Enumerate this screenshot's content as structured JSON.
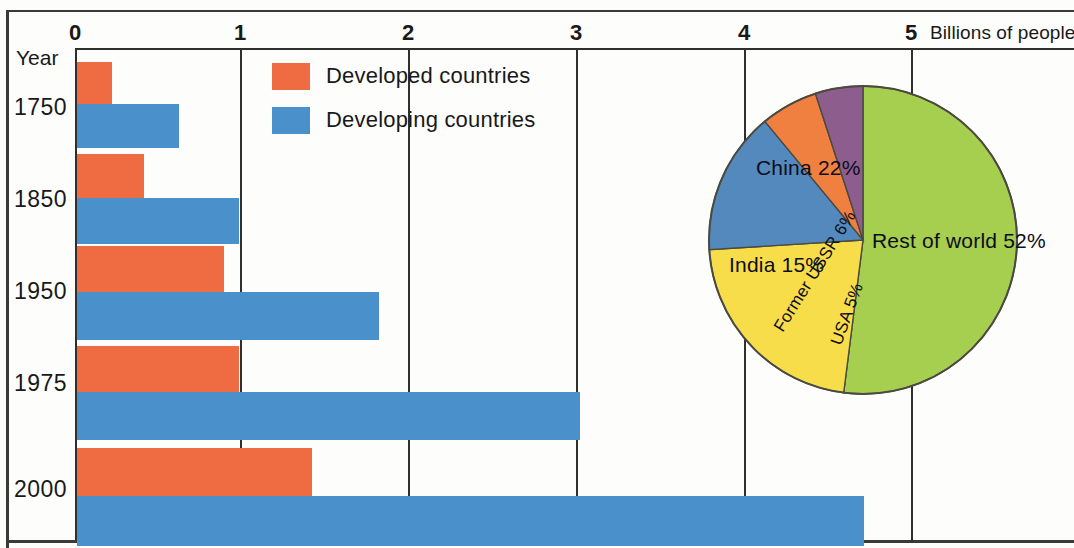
{
  "axis": {
    "unit_label": "Billions of people",
    "ticks": [
      "0",
      "1",
      "2",
      "3",
      "4",
      "5"
    ],
    "year_header": "Year"
  },
  "legend": {
    "items": [
      {
        "label": "Developed countries",
        "color": "#ef6b42"
      },
      {
        "label": "Developing countries",
        "color": "#4a90cb"
      }
    ]
  },
  "pie_labels": {
    "rest": "Rest of world 52%",
    "china": "China 22%",
    "india": "India 15%",
    "ussr": "Former USSR 6%",
    "usa": "USA 5%"
  },
  "years": [
    "1750",
    "1850",
    "1950",
    "1975",
    "2000"
  ],
  "chart_data": [
    {
      "type": "bar",
      "title": "",
      "orientation": "horizontal",
      "xlabel": "Billions of people",
      "ylabel": "Year",
      "xlim": [
        0,
        6
      ],
      "xticks": [
        0,
        1,
        2,
        3,
        4,
        5
      ],
      "grid": true,
      "legend_position": "top-center",
      "categories": [
        "1750",
        "1850",
        "1950",
        "1975",
        "2000"
      ],
      "series": [
        {
          "name": "Developed countries",
          "color": "#ef6b42",
          "values": [
            0.21,
            0.4,
            0.88,
            0.97,
            1.4
          ]
        },
        {
          "name": "Developing countries",
          "color": "#4a90cb",
          "values": [
            0.61,
            0.97,
            1.8,
            3.0,
            4.7
          ]
        }
      ]
    },
    {
      "type": "pie",
      "title": "",
      "labels": [
        "Rest of world",
        "China",
        "India",
        "Former USSR",
        "USA"
      ],
      "values": [
        52,
        22,
        15,
        6,
        5
      ],
      "display_labels": [
        "Rest of world 52%",
        "China 22%",
        "India 15%",
        "Former USSR 6%",
        "USA 5%"
      ],
      "colors": [
        "#a6ce4f",
        "#f8dd4a",
        "#5489be",
        "#f0803f",
        "#8d5d8d"
      ],
      "start_angle_deg": 0,
      "direction": "clockwise",
      "units": "percent"
    }
  ]
}
